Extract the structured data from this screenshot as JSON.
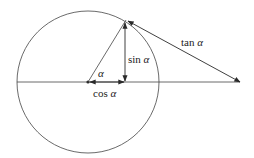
{
  "diagram": {
    "type": "unit-circle-trig",
    "labels": {
      "alpha": "α",
      "sin": "sin ",
      "cos": "cos ",
      "tan": "tan ",
      "alpha_sym": "α"
    },
    "colors": {
      "stroke": "#2a2a2a",
      "text": "#222222",
      "background": "#ffffff"
    }
  }
}
